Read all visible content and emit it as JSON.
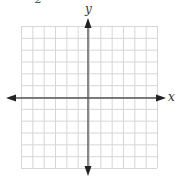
{
  "problem_number": "2",
  "graph": {
    "x_axis_label": "x",
    "y_axis_label": "y",
    "grid": {
      "columns": 12,
      "rows": 12,
      "cells_left_of_y_axis": 6,
      "cells_right_of_y_axis": 6,
      "cells_above_x_axis": 6,
      "cells_below_x_axis": 6,
      "left": 21,
      "right": 157,
      "top": 26,
      "bottom": 168
    },
    "origin": {
      "x": 88,
      "y": 98
    },
    "colors": {
      "grid_line": "#d6d6d6",
      "axis_line": "#555555",
      "arrow": "#222222",
      "background": "#ffffff"
    }
  }
}
